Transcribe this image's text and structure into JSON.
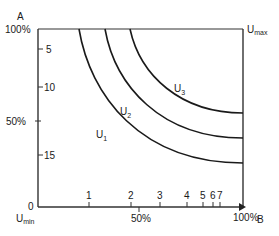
{
  "diagram": {
    "y_axis": {
      "label": "A",
      "top_label": "100%",
      "mid_label": "50%",
      "zero_label": "0",
      "ticks": [
        "5",
        "10",
        "15"
      ]
    },
    "x_axis": {
      "label": "B",
      "right_label": "100%",
      "mid_label": "50%",
      "ticks": [
        "1",
        "2",
        "3",
        "4",
        "5",
        "6",
        "7"
      ]
    },
    "corners": {
      "min_main": "U",
      "min_sub": "min",
      "max_main": "U",
      "max_sub": "max"
    },
    "curves": [
      {
        "main": "U",
        "sub": "1"
      },
      {
        "main": "U",
        "sub": "2"
      },
      {
        "main": "U",
        "sub": "3"
      }
    ],
    "line_color": "#1a1a1a"
  }
}
